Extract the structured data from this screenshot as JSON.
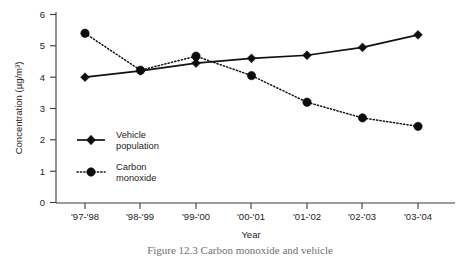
{
  "chart_data": {
    "type": "line",
    "title": "",
    "xlabel": "Year",
    "ylabel": "Concentration (µg/m³)",
    "categories": [
      "'97-'98",
      "'98-'99",
      "'99-'00",
      "'00-'01",
      "'01-'02",
      "'02-'03",
      "'03-'04"
    ],
    "ylim": [
      0,
      6
    ],
    "yticks": [
      "0",
      "1",
      "2",
      "3",
      "4",
      "5",
      "6"
    ],
    "grid": false,
    "legend_position": "inside-lower-left",
    "series": [
      {
        "name": "Vehicle population",
        "marker": "diamond",
        "line_style": "solid",
        "color": "#111111",
        "values": [
          4.0,
          4.2,
          4.45,
          4.6,
          4.7,
          4.95,
          5.35
        ]
      },
      {
        "name": "Carbon monoxide",
        "marker": "circle",
        "line_style": "dotted",
        "color": "#111111",
        "values": [
          5.4,
          4.22,
          4.67,
          4.05,
          3.2,
          2.7,
          2.43
        ]
      }
    ]
  },
  "figure": {
    "caption": "Figure 12.3  Carbon monoxide and vehicle"
  },
  "legend": {
    "items": [
      {
        "label_line1": "Vehicle",
        "label_line2": "population"
      },
      {
        "label_line1": "Carbon",
        "label_line2": "monoxide"
      }
    ]
  }
}
